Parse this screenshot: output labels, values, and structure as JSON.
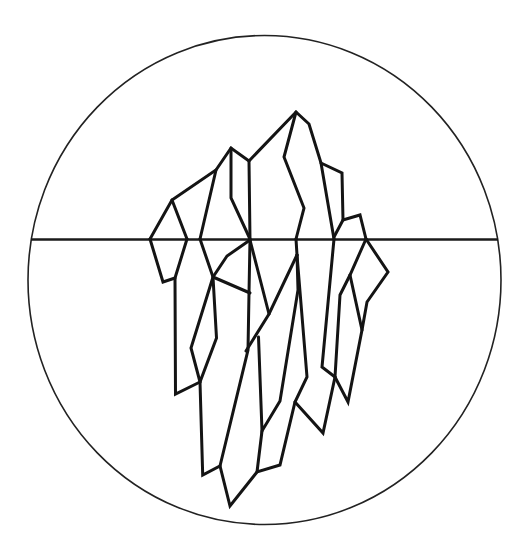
{
  "illustration": {
    "title": "Iceberg line illustration",
    "subject": "iceberg",
    "style": "monochrome line art",
    "frame_shape": "circle",
    "has_waterline": true,
    "colors": {
      "background": "#ffffff",
      "stroke": "#141414",
      "frame_stroke": "#222222"
    }
  },
  "icons": {
    "iceberg": "iceberg-icon",
    "frame": "circle-frame-icon",
    "waterline": "waterline-icon"
  }
}
